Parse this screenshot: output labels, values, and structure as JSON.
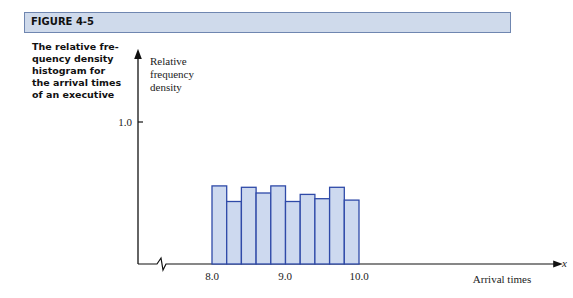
{
  "header": {
    "label": "FIGURE 4-5"
  },
  "caption": {
    "lines": [
      "The relative fre-",
      "quency density",
      "histogram for",
      "the arrival times",
      "of an executive"
    ]
  },
  "colors": {
    "bar_fill": "#cdd9ef",
    "bar_stroke": "#2f4aa8",
    "header_bg": "#cfdaeb"
  },
  "chart_data": {
    "type": "bar",
    "xlabel": "Arrival times",
    "ylabel": "Relative frequency density",
    "x_axis_symbol": "x",
    "bin_edges": [
      8.0,
      8.2,
      8.4,
      8.6,
      8.8,
      9.0,
      9.2,
      9.4,
      9.6,
      9.8,
      10.0
    ],
    "categories": [
      "8.0-8.2",
      "8.2-8.4",
      "8.4-8.6",
      "8.6-8.8",
      "8.8-9.0",
      "9.0-9.2",
      "9.2-9.4",
      "9.4-9.6",
      "9.6-9.8",
      "9.8-10.0"
    ],
    "values": [
      0.55,
      0.44,
      0.54,
      0.5,
      0.55,
      0.44,
      0.49,
      0.46,
      0.54,
      0.45
    ],
    "x_ticks": [
      "8.0",
      "9.0",
      "10.0"
    ],
    "y_ticks": [
      "1.0"
    ],
    "ylim": [
      0,
      1.2
    ],
    "axis_break": true,
    "grid": false,
    "legend": null
  }
}
